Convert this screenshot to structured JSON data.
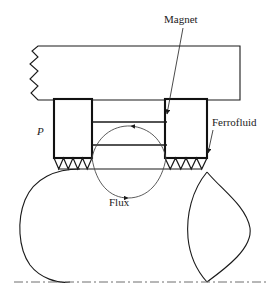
{
  "figure": {
    "background_color": "#ffffff",
    "line_color": "#1a1a1a",
    "thin_line_color": "#3a3a3a",
    "width": 278,
    "height": 295
  },
  "labels": {
    "magnet": "Magnet",
    "ferrofluid": "Ferrofluid",
    "flux": "Flux",
    "pole": "P"
  },
  "annotations": [
    {
      "name": "magnet-label",
      "text": "Magnet",
      "text_x": 165,
      "text_y": 22,
      "leader_from": [
        182,
        27
      ],
      "leader_to": [
        166,
        120
      ],
      "arrowhead": "down"
    },
    {
      "name": "ferrofluid-label",
      "text": "Ferrofluid",
      "text_x": 212,
      "text_y": 125,
      "leader_from": [
        214,
        130
      ],
      "leader_to": [
        208,
        158
      ],
      "arrowhead": "down-left"
    },
    {
      "name": "flux-label",
      "text": "Flux",
      "text_x": 109,
      "text_y": 204,
      "leader_from": null,
      "leader_to": null,
      "arrowhead": "none"
    },
    {
      "name": "pole-label",
      "text": "P",
      "text_x": 38,
      "text_y": 134,
      "leader_from": null,
      "leader_to": null,
      "arrowhead": "none"
    }
  ],
  "geometry": {
    "housing_block": {
      "name": "housing-block",
      "top": 46,
      "bottom": 100,
      "left": 30,
      "right": 240,
      "break_edge": "left-zigzag"
    },
    "pole_left": {
      "name": "pole-piece-left",
      "left": 54,
      "right": 92,
      "top": 99,
      "bottom": 158
    },
    "pole_right": {
      "name": "pole-piece-right",
      "left": 165,
      "right": 207,
      "top": 99,
      "bottom": 158
    },
    "gap_lines_y": [
      122,
      145
    ],
    "gap_left": 92,
    "gap_right": 165,
    "sawtooth": {
      "teeth_count": 4,
      "top_y": 158,
      "bottom_y": 169,
      "left_span": [
        54,
        92
      ],
      "right_span": [
        165,
        207
      ]
    },
    "shaft_top_y": 169,
    "centerline_y": 282,
    "rotor_left": {
      "name": "rotor-body-left",
      "min_x": 22,
      "max_x": 92,
      "apex_bottom": [
        70,
        282
      ]
    },
    "rotor_right": {
      "name": "rotor-lens-right",
      "top": [
        207,
        172
      ],
      "bottom": [
        207,
        282
      ],
      "left_bulge": 188,
      "right_bulge": 250
    },
    "flux_loop_outer": {
      "name": "flux-path-lower",
      "start": [
        92,
        158
      ],
      "end": [
        165,
        158
      ],
      "sag_y": 200,
      "arrow_at": [
        128,
        198
      ],
      "direction": "right"
    },
    "flux_loop_inner": {
      "name": "flux-path-upper",
      "start": [
        165,
        134
      ],
      "end": [
        92,
        134
      ],
      "rise_y": 124,
      "arrow_at": [
        128,
        126
      ],
      "direction": "left"
    }
  },
  "colors": {
    "stroke": "#1a1a1a",
    "stroke_thin": "#3f3f3f",
    "fill": "none",
    "centerline": "#777777"
  }
}
